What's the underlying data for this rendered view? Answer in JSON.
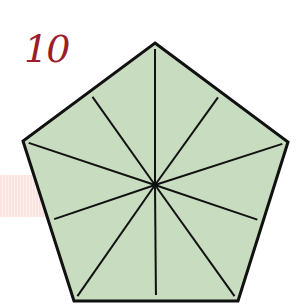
{
  "label": "10",
  "figure": {
    "shape": "regular pentagon",
    "sides": 5,
    "center_lines": 10,
    "lines_to_vertices": 5,
    "lines_to_edge_midpoints": 5
  },
  "colors": {
    "label": "#9b1c2a",
    "fill": "#c8dcc0",
    "stroke": "#111111",
    "band": "#fbe3e0"
  }
}
